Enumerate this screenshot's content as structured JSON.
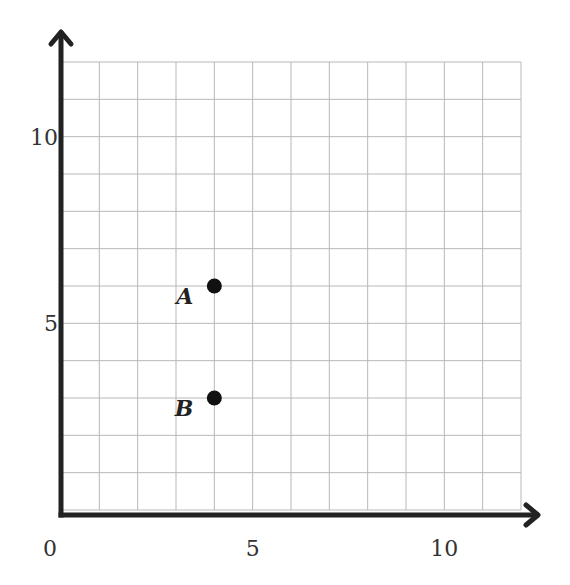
{
  "chart_data": {
    "type": "scatter",
    "title": "",
    "xlabel": "",
    "ylabel": "",
    "xlim": [
      0,
      12
    ],
    "ylim": [
      0,
      12
    ],
    "grid": true,
    "grid_step": 1,
    "x_ticks": [
      {
        "value": 0,
        "label": "0"
      },
      {
        "value": 5,
        "label": "5"
      },
      {
        "value": 10,
        "label": "10"
      }
    ],
    "y_ticks": [
      {
        "value": 5,
        "label": "5"
      },
      {
        "value": 10,
        "label": "10"
      }
    ],
    "points": [
      {
        "label": "A",
        "x": 4,
        "y": 6
      },
      {
        "label": "B",
        "x": 4,
        "y": 3
      }
    ],
    "colors": {
      "grid": "#b8b8b8",
      "axis": "#222222",
      "point": "#111111"
    }
  }
}
